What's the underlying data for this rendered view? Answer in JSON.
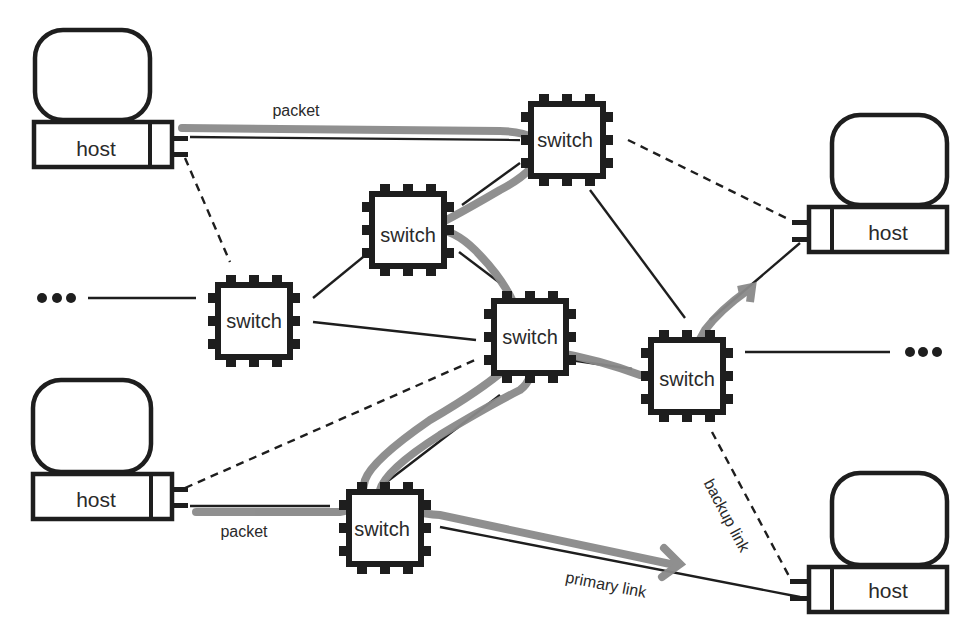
{
  "diagram": {
    "title": "",
    "colors": {
      "stroke": "#1e1e1e",
      "packet_path": "#8a8a8a",
      "background": "#ffffff"
    },
    "hosts": [
      {
        "id": "host-top-left",
        "label": "host"
      },
      {
        "id": "host-bottom-left",
        "label": "host"
      },
      {
        "id": "host-right-upper",
        "label": "host"
      },
      {
        "id": "host-bottom-right",
        "label": "host"
      }
    ],
    "switches": [
      {
        "id": "switch-top",
        "label": "switch"
      },
      {
        "id": "switch-upper-mid",
        "label": "switch"
      },
      {
        "id": "switch-left",
        "label": "switch"
      },
      {
        "id": "switch-center",
        "label": "switch"
      },
      {
        "id": "switch-right",
        "label": "switch"
      },
      {
        "id": "switch-bottom",
        "label": "switch"
      }
    ],
    "ellipsis": {
      "left": "•••",
      "right": "•••"
    },
    "edge_labels": {
      "packet_top": "packet",
      "packet_bottom": "packet",
      "primary_link": "primary link",
      "backup_link": "backup link"
    }
  }
}
